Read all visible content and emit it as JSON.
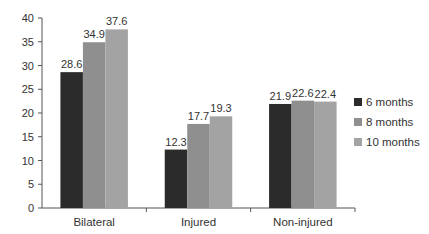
{
  "chart_data": {
    "type": "bar",
    "title": "",
    "xlabel": "",
    "ylabel": "",
    "ylim": [
      0,
      40
    ],
    "yticks": [
      0,
      5,
      10,
      15,
      20,
      25,
      30,
      35,
      40
    ],
    "grid": false,
    "legend_position": "right",
    "categories": [
      "Bilateral",
      "Injured",
      "Non-injured"
    ],
    "series": [
      {
        "name": "6 months",
        "color": "#2b2b2b",
        "values": [
          28.6,
          12.3,
          21.9
        ]
      },
      {
        "name": "8 months",
        "color": "#8f8f8f",
        "values": [
          34.9,
          17.7,
          22.6
        ]
      },
      {
        "name": "10 months",
        "color": "#a3a3a3",
        "values": [
          37.6,
          19.3,
          22.4
        ]
      }
    ]
  }
}
